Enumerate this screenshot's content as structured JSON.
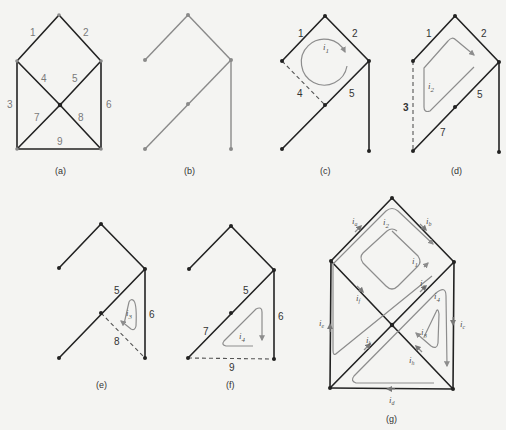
{
  "figure": {
    "panels": [
      {
        "id": "a",
        "caption": "(a)",
        "edges": [
          "1",
          "2",
          "3",
          "4",
          "5",
          "6",
          "7",
          "8",
          "9"
        ]
      },
      {
        "id": "b",
        "caption": "(b)"
      },
      {
        "id": "c",
        "caption": "(c)",
        "edges": [
          "1",
          "2",
          "4",
          "5"
        ],
        "current": "i1"
      },
      {
        "id": "d",
        "caption": "(d)",
        "edges": [
          "1",
          "2",
          "3",
          "5",
          "7"
        ],
        "current": "i2"
      },
      {
        "id": "e",
        "caption": "(e)",
        "edges": [
          "5",
          "6",
          "8"
        ],
        "current": "i3"
      },
      {
        "id": "f",
        "caption": "(f)",
        "edges": [
          "5",
          "6",
          "7",
          "9"
        ],
        "current": "i4"
      },
      {
        "id": "g",
        "caption": "(g)",
        "mesh_currents": [
          "i1",
          "i2",
          "i3",
          "i4"
        ],
        "branch_currents": [
          "ia",
          "ib",
          "ic",
          "id",
          "ie",
          "if",
          "ig",
          "ih",
          "ik"
        ]
      }
    ]
  },
  "labels": {
    "e1": "1",
    "e2": "2",
    "e3": "3",
    "e4": "4",
    "e5": "5",
    "e6": "6",
    "e7": "7",
    "e8": "8",
    "e9": "9",
    "i1": "i",
    "i2": "i",
    "i3": "i",
    "i4": "i",
    "s1": "1",
    "s2": "2",
    "s3": "3",
    "s4": "4",
    "ia": "a",
    "ib": "b",
    "ic": "c",
    "id": "d",
    "ie": "e",
    "if": "f",
    "ig": "g",
    "ih": "h",
    "ik": "k"
  },
  "captions": {
    "a": "(a)",
    "b": "(b)",
    "c": "(c)",
    "d": "(d)",
    "e": "(e)",
    "f": "(f)",
    "g": "(g)"
  }
}
